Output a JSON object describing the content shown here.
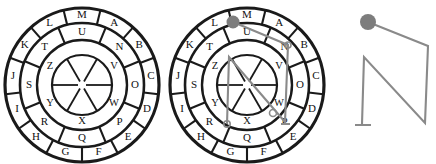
{
  "diagram": {
    "figures": [
      {
        "id": "wheel-plain",
        "name": "cipher-wheel-left",
        "center": {
          "x": 82,
          "y": 85
        },
        "radii": {
          "outer": 77,
          "ring2": 62,
          "ring3": 45,
          "ring4": 30,
          "hub": 4
        },
        "rings": [
          {
            "name": "outer-ring",
            "count": 13,
            "labels": [
              "A",
              "B",
              "C",
              "D",
              "E",
              "F",
              "G",
              "H",
              "I",
              "J",
              "K",
              "L",
              "M"
            ],
            "label_radius": 69.5,
            "font_size": 11,
            "start_angle": -76.15,
            "step": 27.692
          },
          {
            "name": "middle-ring",
            "count": 8,
            "labels": [
              "N",
              "O",
              "P",
              "Q",
              "R",
              "S",
              "T",
              "U"
            ],
            "label_radius": 53,
            "font_size": 11,
            "start_angle": -67.5,
            "step": 45
          },
          {
            "name": "inner-ring",
            "count": 6,
            "labels": [
              "V",
              "W",
              "X",
              "Y",
              "Z",
              ""
            ],
            "label_radius": 37,
            "font_size": 10.5,
            "start_angle": -60,
            "step": 60
          }
        ],
        "overlay": null
      },
      {
        "id": "wheel-marked",
        "name": "cipher-wheel-middle",
        "center": {
          "x": 247,
          "y": 85
        },
        "radii": {
          "outer": 77,
          "ring2": 62,
          "ring3": 45,
          "ring4": 30,
          "hub": 4
        },
        "rings": [
          {
            "name": "outer-ring",
            "count": 13,
            "labels": [
              "A",
              "B",
              "C",
              "D",
              "E",
              "F",
              "G",
              "H",
              "I",
              "J",
              "K",
              "L",
              "M"
            ],
            "label_radius": 69.5,
            "font_size": 11,
            "start_angle": -76.15,
            "step": 27.692
          },
          {
            "name": "middle-ring",
            "count": 8,
            "labels": [
              "N",
              "O",
              "P",
              "Q",
              "R",
              "S",
              "T",
              "U"
            ],
            "label_radius": 53,
            "font_size": 11,
            "start_angle": -67.5,
            "step": 45
          },
          {
            "name": "inner-ring",
            "count": 6,
            "labels": [
              "V",
              "W",
              "X",
              "Y",
              "Z",
              ""
            ],
            "label_radius": 37,
            "font_size": 10.5,
            "start_angle": -60,
            "step": 60
          }
        ],
        "overlay": {
          "name": "traced-key-path",
          "start_dot": {
            "x": 233,
            "y": 22,
            "r": 6.5
          },
          "points": [
            {
              "x": 233,
              "y": 22
            },
            {
              "x": 288,
              "y": 45
            },
            {
              "x": 285,
              "y": 122
            },
            {
              "x": 229,
              "y": 57
            },
            {
              "x": 227,
              "y": 124
            }
          ],
          "pins": [
            {
              "x": 288,
              "y": 45,
              "r": 3
            },
            {
              "x": 273,
              "y": 113,
              "r": 3.5
            },
            {
              "x": 227,
              "y": 124,
              "r": 3.2
            }
          ],
          "foot": {
            "x1": 281,
            "y1": 124,
            "x2": 290,
            "y2": 124
          }
        }
      },
      {
        "id": "path-only",
        "name": "extracted-path",
        "overlay": {
          "name": "traced-key-path-isolated",
          "start_dot": {
            "x": 368,
            "y": 22,
            "r": 8
          },
          "points": [
            {
              "x": 368,
              "y": 22
            },
            {
              "x": 428,
              "y": 46
            },
            {
              "x": 425,
              "y": 123
            },
            {
              "x": 364,
              "y": 57
            },
            {
              "x": 362,
              "y": 124
            }
          ],
          "foot": {
            "x1": 355,
            "y1": 125,
            "x2": 371,
            "y2": 125
          }
        }
      }
    ],
    "colors": {
      "ink": "#1a1a1a",
      "overlay": "#8a8a8a",
      "overlay_dot": "#7d7d7d",
      "background": "#ffffff"
    }
  }
}
